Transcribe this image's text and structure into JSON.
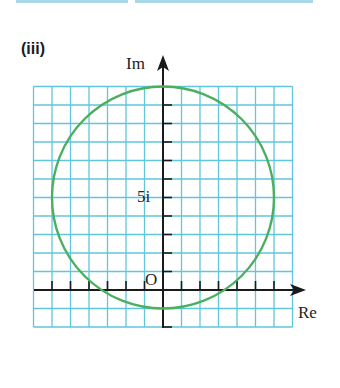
{
  "part_label": "(iii)",
  "axes": {
    "x_label": "Re",
    "y_label": "Im",
    "origin_label": "O",
    "y_tick_label": "5i"
  },
  "colors": {
    "grid": "#5fc6dc",
    "circle": "#4caf60",
    "axis": "#1a1a1a",
    "top_strip": "#a8d8e8"
  },
  "chart_data": {
    "type": "diagram",
    "title": "(iii)",
    "xlabel": "Re",
    "ylabel": "Im",
    "grid_unit": 1,
    "x_range": [
      -7,
      7
    ],
    "y_range": [
      -2,
      11
    ],
    "circle": {
      "center": [
        0,
        5
      ],
      "radius": 6
    },
    "labeled_points": [
      {
        "label": "O",
        "x": 0,
        "y": 0
      },
      {
        "label": "5i",
        "x": 0,
        "y": 5
      }
    ]
  }
}
